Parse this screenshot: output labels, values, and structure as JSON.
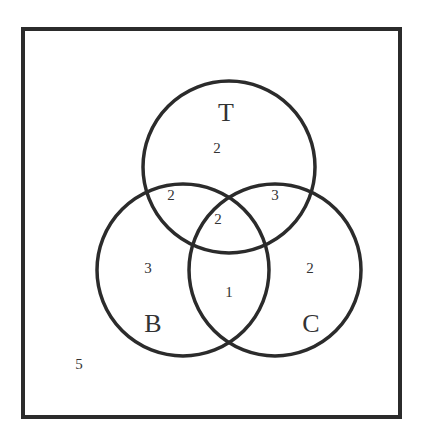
{
  "diagram": {
    "type": "venn-3-set",
    "colors": {
      "stroke": "#2b2b2b",
      "text": "#333333",
      "background": "#ffffff"
    },
    "sets": [
      {
        "name": "T"
      },
      {
        "name": "B"
      },
      {
        "name": "C"
      }
    ],
    "regions": {
      "T_only": "2",
      "B_only": "3",
      "C_only": "2",
      "T_and_B_only": "2",
      "T_and_C_only": "3",
      "B_and_C_only": "1",
      "T_and_B_and_C": "2",
      "outside": "5"
    }
  }
}
